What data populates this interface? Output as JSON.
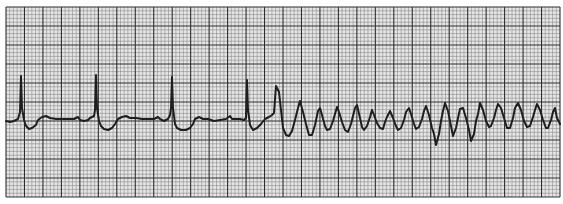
{
  "chart_data": {
    "type": "line",
    "title": "",
    "subtitle": "",
    "xlabel": "",
    "ylabel": "",
    "grid": true,
    "legend": null,
    "colors": {
      "paper": "#e6e6e6",
      "minor_grid": "#8a8a8a",
      "major_grid": "#2e2e2e",
      "trace": "#1e1e1e",
      "background": "#ffffff"
    },
    "grid_box": {
      "x0": 6,
      "y0": 7,
      "x1": 560,
      "y1": 197,
      "minor_px": 3.7,
      "major_px": 18.5
    },
    "baseline_y": 121,
    "sinus_r_peaks_x": [
      21,
      96,
      172,
      247
    ],
    "vt_onset_x": 276,
    "series": [
      {
        "name": "ECG trace",
        "points": [
          [
            6,
            121
          ],
          [
            10,
            122
          ],
          [
            14,
            121
          ],
          [
            18,
            119
          ],
          [
            20,
            112
          ],
          [
            21,
            76
          ],
          [
            22,
            108
          ],
          [
            24,
            120
          ],
          [
            26,
            126
          ],
          [
            29,
            129
          ],
          [
            32,
            128
          ],
          [
            36,
            125
          ],
          [
            38,
            120
          ],
          [
            42,
            117
          ],
          [
            46,
            116
          ],
          [
            50,
            118
          ],
          [
            56,
            119
          ],
          [
            62,
            119
          ],
          [
            68,
            119
          ],
          [
            74,
            119
          ],
          [
            78,
            117
          ],
          [
            80,
            120
          ],
          [
            84,
            121
          ],
          [
            88,
            120
          ],
          [
            90,
            118
          ],
          [
            94,
            116
          ],
          [
            95,
            110
          ],
          [
            96,
            75
          ],
          [
            97,
            108
          ],
          [
            99,
            121
          ],
          [
            101,
            126
          ],
          [
            104,
            129
          ],
          [
            108,
            130
          ],
          [
            112,
            128
          ],
          [
            115,
            124
          ],
          [
            118,
            119
          ],
          [
            122,
            117
          ],
          [
            126,
            116
          ],
          [
            130,
            118
          ],
          [
            136,
            118
          ],
          [
            142,
            119
          ],
          [
            148,
            119
          ],
          [
            154,
            119
          ],
          [
            158,
            117
          ],
          [
            160,
            119
          ],
          [
            164,
            121
          ],
          [
            168,
            119
          ],
          [
            170,
            115
          ],
          [
            171,
            108
          ],
          [
            172,
            77
          ],
          [
            173,
            108
          ],
          [
            175,
            124
          ],
          [
            177,
            128
          ],
          [
            181,
            130
          ],
          [
            186,
            130
          ],
          [
            190,
            128
          ],
          [
            193,
            124
          ],
          [
            195,
            119
          ],
          [
            199,
            117
          ],
          [
            203,
            119
          ],
          [
            208,
            119
          ],
          [
            214,
            121
          ],
          [
            220,
            120
          ],
          [
            226,
            119
          ],
          [
            230,
            116
          ],
          [
            232,
            119
          ],
          [
            236,
            119
          ],
          [
            240,
            119
          ],
          [
            244,
            120
          ],
          [
            246,
            118
          ],
          [
            247,
            80
          ],
          [
            248,
            110
          ],
          [
            250,
            125
          ],
          [
            253,
            130
          ],
          [
            257,
            128
          ],
          [
            261,
            124
          ],
          [
            265,
            119
          ],
          [
            269,
            117
          ],
          [
            272,
            115
          ],
          [
            274,
            113
          ],
          [
            276,
            86
          ],
          [
            279,
            92
          ],
          [
            281,
            110
          ],
          [
            283,
            128
          ],
          [
            286,
            135
          ],
          [
            289,
            136
          ],
          [
            292,
            131
          ],
          [
            295,
            120
          ],
          [
            298,
            108
          ],
          [
            300,
            101
          ],
          [
            303,
            112
          ],
          [
            306,
            124
          ],
          [
            309,
            135
          ],
          [
            312,
            135
          ],
          [
            315,
            125
          ],
          [
            318,
            111
          ],
          [
            320,
            108
          ],
          [
            322,
            115
          ],
          [
            325,
            126
          ],
          [
            327,
            130
          ],
          [
            330,
            129
          ],
          [
            333,
            121
          ],
          [
            335,
            114
          ],
          [
            337,
            107
          ],
          [
            339,
            112
          ],
          [
            342,
            122
          ],
          [
            345,
            130
          ],
          [
            348,
            132
          ],
          [
            351,
            124
          ],
          [
            353,
            116
          ],
          [
            355,
            108
          ],
          [
            357,
            105
          ],
          [
            360,
            118
          ],
          [
            362,
            127
          ],
          [
            364,
            130
          ],
          [
            367,
            126
          ],
          [
            370,
            117
          ],
          [
            372,
            110
          ],
          [
            374,
            115
          ],
          [
            377,
            123
          ],
          [
            380,
            128
          ],
          [
            383,
            129
          ],
          [
            385,
            122
          ],
          [
            387,
            117
          ],
          [
            390,
            111
          ],
          [
            393,
            118
          ],
          [
            396,
            126
          ],
          [
            398,
            130
          ],
          [
            401,
            128
          ],
          [
            404,
            120
          ],
          [
            406,
            112
          ],
          [
            409,
            108
          ],
          [
            411,
            114
          ],
          [
            414,
            124
          ],
          [
            416,
            129
          ],
          [
            419,
            127
          ],
          [
            422,
            119
          ],
          [
            424,
            111
          ],
          [
            426,
            106
          ],
          [
            429,
            115
          ],
          [
            432,
            128
          ],
          [
            434,
            134
          ],
          [
            436,
            145
          ],
          [
            439,
            134
          ],
          [
            441,
            121
          ],
          [
            443,
            111
          ],
          [
            445,
            103
          ],
          [
            448,
            111
          ],
          [
            451,
            126
          ],
          [
            453,
            136
          ],
          [
            456,
            128
          ],
          [
            458,
            118
          ],
          [
            460,
            109
          ],
          [
            463,
            108
          ],
          [
            466,
            118
          ],
          [
            469,
            130
          ],
          [
            471,
            141
          ],
          [
            474,
            134
          ],
          [
            476,
            121
          ],
          [
            478,
            114
          ],
          [
            480,
            103
          ],
          [
            483,
            110
          ],
          [
            486,
            121
          ],
          [
            489,
            127
          ],
          [
            491,
            126
          ],
          [
            494,
            118
          ],
          [
            496,
            110
          ],
          [
            498,
            104
          ],
          [
            501,
            108
          ],
          [
            504,
            118
          ],
          [
            507,
            128
          ],
          [
            510,
            128
          ],
          [
            513,
            118
          ],
          [
            515,
            108
          ],
          [
            518,
            103
          ],
          [
            521,
            110
          ],
          [
            524,
            121
          ],
          [
            527,
            127
          ],
          [
            530,
            126
          ],
          [
            533,
            117
          ],
          [
            535,
            110
          ],
          [
            537,
            104
          ],
          [
            540,
            110
          ],
          [
            543,
            120
          ],
          [
            546,
            128
          ],
          [
            548,
            128
          ],
          [
            551,
            120
          ],
          [
            553,
            112
          ],
          [
            555,
            108
          ],
          [
            557,
            118
          ],
          [
            560,
            124
          ]
        ]
      }
    ]
  }
}
